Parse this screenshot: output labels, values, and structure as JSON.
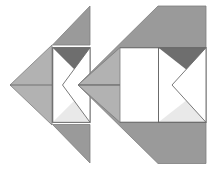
{
  "figure": {
    "title": "",
    "kind": "geometric-dissection-puzzle",
    "background_color": "#ffffff",
    "arrow_label": "→",
    "arrow_color": "#1a1a1a",
    "palette": {
      "light_gray": "#b2b2b2",
      "medium_gray": "#9a9a9a",
      "dark_gray": "#6e6e6e",
      "pale_gray": "#e9e9e9",
      "white": "#ffffff",
      "outline": "#6b6b6b"
    },
    "panels": [
      {
        "name": "before",
        "label": "",
        "description": "separated pieces"
      },
      {
        "name": "after",
        "label": "",
        "description": "assembled arrow"
      }
    ],
    "pieces": [
      {
        "id": "left-wedge",
        "name": "light-gray-left-pointing-triangle",
        "fill": "#b2b2b2"
      },
      {
        "id": "top-triangle",
        "name": "medium-gray-top-triangle",
        "fill": "#9a9a9a"
      },
      {
        "id": "bottom-triangle",
        "name": "medium-gray-bottom-triangle",
        "fill": "#9a9a9a"
      },
      {
        "id": "square-dark",
        "name": "dark-gray-upper-square-triangle",
        "fill": "#6e6e6e"
      },
      {
        "id": "square-pale",
        "name": "pale-gray-lower-square-triangle",
        "fill": "#e9e9e9"
      },
      {
        "id": "square-notch",
        "name": "white-chevron-notch",
        "fill": "#ffffff"
      }
    ],
    "geometry": {
      "before": {
        "left_wedge": "10,85 52,45 52,125",
        "top_triangle": "52,45 90,45 90,6",
        "bottom_triangle": "52,124 90,124 90,163",
        "square": {
          "x": 52.5,
          "y": 47.5,
          "w": 37.5,
          "h": 75
        },
        "square_dark": "52.5,47.5 90,47.5 90,85",
        "square_pale": "52.5,122.5 90,122.5 90,85",
        "square_notch": "90,47.5 62,85 90,122.5"
      },
      "after": {
        "left_wedge": "78,85 120,45 120,125",
        "top_triangle": "120,45 158,45 158,6",
        "bottom_triangle": "120,124 158,124 158,163",
        "outer_top": "78,85 158,6 206,6 206,47.5 120,47.5",
        "outer_bottom": "78,85 158,163 206,163 206,122.5 120,122.5",
        "square": {
          "x": 158.5,
          "y": 47.5,
          "w": 47.5,
          "h": 75
        },
        "square_dark": "158.5,47.5 206,47.5 206,85",
        "square_pale": "158.5,122.5 206,122.5 206,85",
        "square_notch": "206,47.5 172,85 206,122.5"
      },
      "arrow": {
        "x1": 98,
        "y1": 85,
        "x2": 117,
        "y2": 85
      }
    }
  }
}
